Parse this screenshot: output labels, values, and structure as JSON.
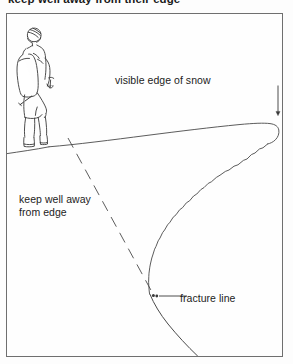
{
  "page": {
    "width": 293,
    "height": 364,
    "background": "#ffffff",
    "ink_color": "#231f20",
    "frame_color": "#6f6f6f"
  },
  "caption": {
    "heading": "keep well away from their edge"
  },
  "figure": {
    "frame": {
      "x": 6,
      "y": 13,
      "width": 277,
      "height": 344
    },
    "labels": [
      {
        "id": "visible-edge-of-snow",
        "text": "visible edge of snow",
        "x": 108,
        "y": 60,
        "leader": "vertical-arrow-down"
      },
      {
        "id": "keep-well-away-from-edge",
        "line1": "keep well away",
        "line2": "from edge",
        "x": 12,
        "y": 179,
        "leader": "none"
      },
      {
        "id": "fracture-line",
        "text": "fracture line",
        "x": 173,
        "y": 278,
        "leader": "horizontal-line-left-with-dot"
      }
    ],
    "elements": [
      {
        "id": "hiker-figure",
        "description": "standing hiker with helmet, backpack and ice axe near cornice edge"
      },
      {
        "id": "cornice-top-edge",
        "description": "snow surface curving right and rolling over the cornice tip"
      },
      {
        "id": "cornice-underside",
        "description": "jagged broken snow face below overhanging cornice"
      },
      {
        "id": "fracture-dashed-line",
        "description": "dashed line from behind hiker down to the fracture point"
      },
      {
        "id": "rock-slope-line",
        "description": "slope continuing down-right to bottom of frame"
      },
      {
        "id": "fracture-point-dot",
        "description": "small dot marking where the fracture line meets the slope"
      }
    ]
  }
}
